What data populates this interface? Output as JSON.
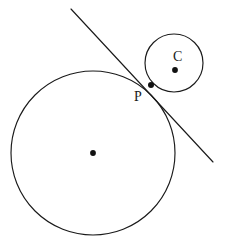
{
  "figure": {
    "type": "geometry-diagram",
    "width": 236,
    "height": 251,
    "background_color": "#ffffff",
    "stroke_color": "#1a1a1a",
    "stroke_width": 1.1
  },
  "labels": {
    "tangent_point": "P",
    "small_circle_center": "C"
  },
  "shapes": {
    "large_circle": {
      "name": "large-circle",
      "cx": 93,
      "cy": 153,
      "r": 82,
      "stroke": "#1a1a1a",
      "fill": "none"
    },
    "small_circle": {
      "name": "small-circle",
      "cx": 174,
      "cy": 63,
      "r": 29,
      "stroke": "#1a1a1a",
      "fill": "none"
    },
    "tangent_line": {
      "name": "tangent-line",
      "x1": 71,
      "y1": 9,
      "x2": 213,
      "y2": 162,
      "stroke": "#1a1a1a"
    },
    "large_circle_center_dot": {
      "name": "large-circle-center-dot",
      "cx": 93,
      "cy": 153,
      "r": 2.9,
      "fill": "#111111"
    },
    "small_circle_center_dot": {
      "name": "small-circle-center-dot",
      "cx": 175,
      "cy": 70,
      "r": 2.9,
      "fill": "#111111"
    },
    "tangent_point_dot": {
      "name": "tangent-point-dot",
      "cx": 151,
      "cy": 85,
      "r": 3.0,
      "fill": "#111111"
    }
  },
  "label_positions": {
    "P": {
      "x": 134,
      "y": 90
    },
    "C": {
      "x": 173,
      "y": 50
    }
  }
}
